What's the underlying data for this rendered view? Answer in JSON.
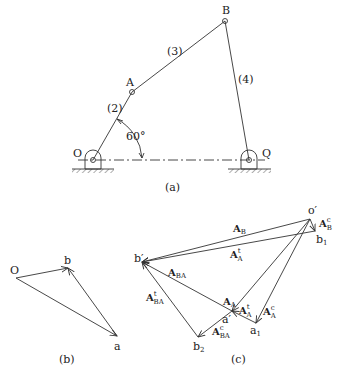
{
  "figure_a": {
    "caption": "(a)",
    "points": {
      "O": "O",
      "A": "A",
      "B": "B",
      "Q": "Q"
    },
    "links": {
      "link2": "(2)",
      "link3": "(3)",
      "link4": "(4)"
    },
    "angle": "60°"
  },
  "figure_b": {
    "caption": "(b)",
    "points": {
      "O": "O",
      "a": "a",
      "b": "b"
    }
  },
  "figure_c": {
    "caption": "(c)",
    "points": {
      "o": "o′",
      "b1": "b",
      "b1_sub": "1",
      "bprime": "b′",
      "aprime": "a′",
      "a1": "a",
      "a1_sub": "1",
      "b2": "b",
      "b2_sub": "2"
    },
    "vectors": {
      "AB": {
        "main": "A",
        "sub": "B"
      },
      "ABc": {
        "main": "A",
        "sup": "c",
        "sub": "B"
      },
      "AAt_top": {
        "main": "A",
        "sup": "t",
        "sub": "A"
      },
      "ABA": {
        "main": "A",
        "sub": "BA"
      },
      "ABAt": {
        "main": "A",
        "sup": "t",
        "sub": "BA"
      },
      "AA": {
        "main": "A",
        "sub": "A"
      },
      "AAt": {
        "main": "A",
        "sup": "t",
        "sub": "A"
      },
      "AAc": {
        "main": "A",
        "sup": "c",
        "sub": "A"
      },
      "ABAc": {
        "main": "A",
        "sup": "c",
        "sub": "BA"
      }
    }
  }
}
